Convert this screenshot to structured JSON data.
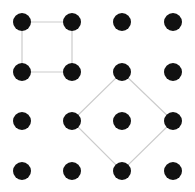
{
  "grid": {
    "columns_x": [
      22,
      72,
      122,
      173
    ],
    "rows_y": [
      22,
      72,
      121,
      171
    ],
    "dot_radius": 9,
    "dot_color": "#111111",
    "line_color": "#cccccc",
    "line_width": 1.2
  },
  "shapes": [
    {
      "name": "square",
      "points": [
        [
          0,
          0
        ],
        [
          1,
          0
        ],
        [
          1,
          1
        ],
        [
          0,
          1
        ]
      ]
    },
    {
      "name": "diamond",
      "points": [
        [
          2,
          1
        ],
        [
          3,
          2
        ],
        [
          2,
          3
        ],
        [
          1,
          2
        ]
      ]
    }
  ]
}
